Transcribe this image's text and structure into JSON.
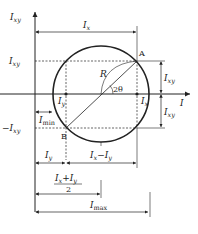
{
  "diagram": {
    "axes": {
      "vertical": {
        "label": "I",
        "sub": "xy"
      },
      "horizontal": {
        "label": "I"
      }
    },
    "points": {
      "A": "A",
      "B": "B"
    },
    "labels": {
      "Ix_top": {
        "main": "I",
        "sub": "x"
      },
      "Ixy_left": {
        "main": "I",
        "sub": "xy"
      },
      "neg_Ixy_left": {
        "main": "−I",
        "sub": "xy"
      },
      "R": "R",
      "two_theta": "2θ",
      "Iy_point": {
        "main": "I",
        "sub": "y"
      },
      "Ix_point": {
        "main": "I",
        "sub": "x"
      },
      "Imin": {
        "main": "I",
        "sub": "min"
      },
      "Ixy_right_upper": {
        "main": "I",
        "sub": "xy"
      },
      "Ixy_right_lower": {
        "main": "I",
        "sub": "xy"
      },
      "Iy_dim": {
        "main": "I",
        "sub": "y"
      },
      "IxminusIy": {
        "a": "I",
        "asub": "x",
        "op": "−",
        "b": "I",
        "bsub": "y"
      },
      "avg": {
        "a": "I",
        "asub": "x",
        "op": "+",
        "b": "I",
        "bsub": "y",
        "den": "2"
      },
      "Imax": {
        "main": "I",
        "sub": "max"
      }
    },
    "colors": {
      "line": "#222222",
      "background": "#ffffff"
    }
  }
}
